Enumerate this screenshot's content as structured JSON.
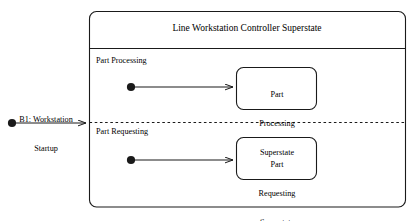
{
  "diagram": {
    "kind": "uml-state-diagram",
    "background_color": "#ffffff",
    "line_color": "#1a1a1a",
    "superstate": {
      "title": "Line Workstation Controller Superstate",
      "regions": [
        {
          "label": "Part Processing",
          "initial_pseudostate": "filled-circle",
          "state": {
            "line1": "Part",
            "line2": "Processing",
            "line3": "Superstate"
          }
        },
        {
          "label": "Part Requesting",
          "initial_pseudostate": "filled-circle",
          "state": {
            "line1": "Part",
            "line2": "Requesting",
            "line3": "Superstate"
          }
        }
      ]
    },
    "incoming_transition": {
      "label_line1": "B1: Workstation",
      "label_line2": "Startup",
      "source_marker": "initial-state-dot",
      "arrowhead": "open-arrow"
    }
  }
}
